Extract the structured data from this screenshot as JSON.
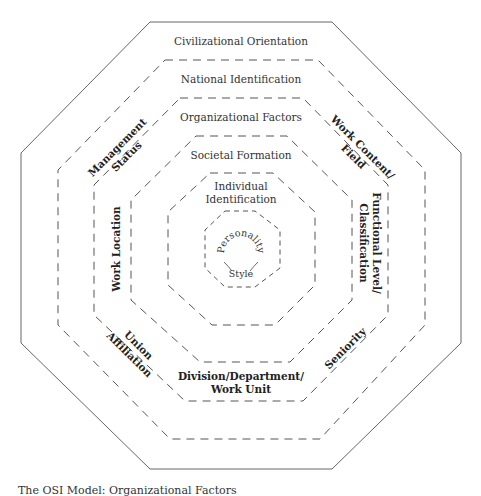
{
  "diagram": {
    "type": "concentric-octagon-model",
    "layers": [
      {
        "name": "Civilizational Orientation",
        "border": "solid"
      },
      {
        "name": "National Identification",
        "border": "dashed"
      },
      {
        "name": "Organizational Factors",
        "border": "dashed"
      },
      {
        "name": "Societal Formation",
        "border": "dashed"
      },
      {
        "name": "Individual Identification",
        "border": "dashed"
      },
      {
        "name": "Personality Style",
        "border": "dashed"
      }
    ],
    "labels": {
      "civilizational": "Civilizational Orientation",
      "national": "National Identification",
      "organizational": "Organizational Factors",
      "societal": "Societal Formation",
      "individual_1": "Individual",
      "individual_2": "Identification",
      "personality_1": "Personality",
      "personality_2": "Style"
    },
    "organizational_factors": {
      "management_1": "Management",
      "management_2": "Status",
      "work_content_1": "Work Content/",
      "work_content_2": "Field",
      "work_location": "Work Location",
      "functional_1": "Functional Level/",
      "functional_2": "Classification",
      "union_1": "Union",
      "union_2": "Affiliation",
      "seniority": "Seniority",
      "division_1": "Division/Department/",
      "division_2": "Work Unit"
    },
    "caption": "The OSI Model: Organizational Factors"
  }
}
